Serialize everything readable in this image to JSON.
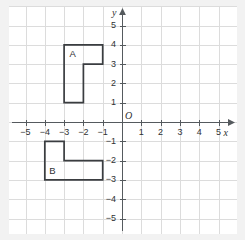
{
  "figure": {
    "type": "coordinate-plane",
    "background_color": "#f2f2f2",
    "plot_background_color": "#ffffff",
    "grid_color": "#dcdcdc",
    "axis_color": "#555a5e",
    "shape_color": "#3a3d40"
  },
  "axes": {
    "x_axis_label": "x",
    "y_axis_label": "y",
    "origin_label": "O",
    "x_min": -6,
    "x_max": 6,
    "y_min": -6,
    "y_max": 6,
    "x_tick_labels": [
      "−5",
      "−4",
      "−3",
      "−2",
      "−1",
      "1",
      "2",
      "3",
      "4",
      "5"
    ],
    "x_tick_values": [
      -5,
      -4,
      -3,
      -2,
      -1,
      1,
      2,
      3,
      4,
      5
    ],
    "y_tick_labels": [
      "5",
      "4",
      "3",
      "2",
      "1",
      "−1",
      "−2",
      "−3",
      "−4",
      "−5"
    ],
    "y_tick_values": [
      5,
      4,
      3,
      2,
      1,
      -1,
      -2,
      -3,
      -4,
      -5
    ],
    "grid": true,
    "grid_step": 1
  },
  "chart_data": {
    "type": "scatter",
    "title": "",
    "xlabel": "x",
    "ylabel": "y",
    "xlim": [
      -6,
      6
    ],
    "ylim": [
      -6,
      6
    ],
    "grid": true,
    "shapes": [
      {
        "label": "A",
        "label_point": [
          -2.55,
          3.5
        ],
        "vertices": [
          [
            -3,
            4
          ],
          [
            -1,
            4
          ],
          [
            -1,
            3
          ],
          [
            -2,
            3
          ],
          [
            -2,
            1
          ],
          [
            -3,
            1
          ]
        ],
        "closed": true
      },
      {
        "label": "B",
        "label_point": [
          -3.6,
          -2.55
        ],
        "vertices": [
          [
            -4,
            -1
          ],
          [
            -3,
            -1
          ],
          [
            -3,
            -2
          ],
          [
            -1,
            -2
          ],
          [
            -1,
            -3
          ],
          [
            -4,
            -3
          ]
        ],
        "closed": true
      }
    ]
  }
}
